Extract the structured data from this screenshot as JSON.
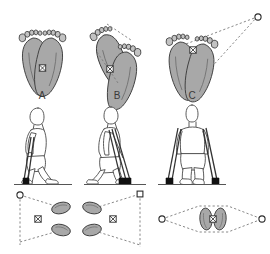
{
  "figure": {
    "background_color": "#ffffff",
    "width": 270,
    "height": 254,
    "colors": {
      "foot_fill": "#a8a8a8",
      "foot_stroke": "#3c3c3c",
      "toe_fill": "#c2c2c2",
      "body_stroke": "#4a4a4a",
      "body_fill": "#ffffff",
      "crutch_stroke": "#333333",
      "crutch_tip": "#111111",
      "dashed_stroke": "#7a7a7a",
      "ground_line": "#555555",
      "marker_stroke": "#2b2b2b",
      "marker_fill": "#ffffff",
      "label_text": "#3a3a3a"
    },
    "rows": [
      {
        "name": "top-row-footprint-diagrams",
        "description": "Plantar view footprints showing base of support polygon"
      },
      {
        "name": "middle-row-figures",
        "description": "Side and front views of a person using walking aids"
      },
      {
        "name": "bottom-row-support-polygons",
        "description": "Footprints plus aid contact points forming the base of support"
      }
    ],
    "panels": [
      {
        "id": "A",
        "label": "A",
        "label_x": 42,
        "label_y": 95,
        "aid": "single cane held on one side",
        "top_diagram": "two feet side by side, toes up, centre of mass between them",
        "middle_figure": "side view walking with one cane",
        "bottom_diagram": "two footprints with one aid contact point on the left"
      },
      {
        "id": "B",
        "label": "B",
        "label_x": 117,
        "label_y": 95,
        "aid": "two crutches on one side",
        "top_diagram": "two staggered feet with dashed support line and centre of mass",
        "middle_figure": "side view walking with two crutches",
        "bottom_diagram": "two footprints with one aid contact point on the right"
      },
      {
        "id": "C",
        "label": "C",
        "label_x": 192,
        "label_y": 95,
        "aid": "two crutches, one on each side",
        "top_diagram": "two feet with large dashed triangle extending to a distant contact point",
        "middle_figure": "front view standing with two crutches",
        "bottom_diagram": "two footprints with aid contact points on both sides forming a lens"
      }
    ],
    "markers": {
      "centre_of_mass": {
        "name": "centre-of-mass-marker",
        "glyph": "crossed square",
        "count": 6
      },
      "aid_contact_circle": {
        "name": "aid-contact-circle-marker",
        "glyph": "open circle",
        "count": 4
      },
      "aid_contact_square": {
        "name": "aid-contact-square-marker",
        "glyph": "open square",
        "count": 1
      }
    }
  }
}
